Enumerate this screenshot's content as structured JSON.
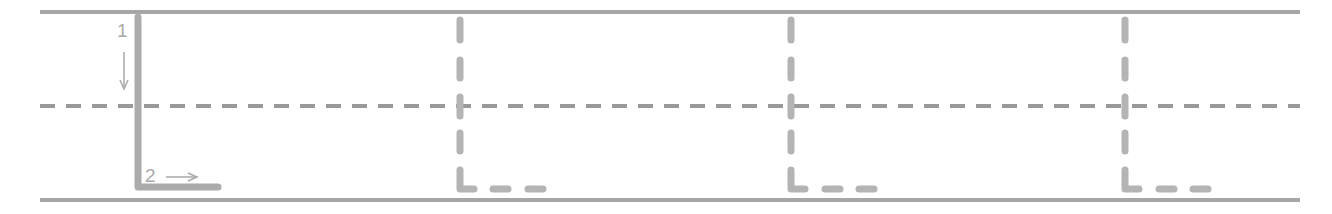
{
  "worksheet": {
    "letter": "L",
    "colors": {
      "guide_line": "#a6a6a6",
      "midline": "#999999",
      "model_stroke": "#ababab",
      "trace_stroke": "#b4b4b4",
      "annotation": "#a9a9a9"
    },
    "guide_lines": {
      "top_y": 12,
      "mid_y": 106,
      "bottom_y": 200,
      "x_start": 40,
      "x_end": 1300
    },
    "model": {
      "x": 138,
      "strokes": [
        {
          "number": "1",
          "direction": "down-arrow",
          "description": "vertical stroke from top line to bottom line"
        },
        {
          "number": "2",
          "direction": "right-arrow",
          "description": "horizontal stroke along bottom line"
        }
      ]
    },
    "tracing_copies": [
      {
        "x": 460
      },
      {
        "x": 791
      },
      {
        "x": 1124
      }
    ]
  }
}
